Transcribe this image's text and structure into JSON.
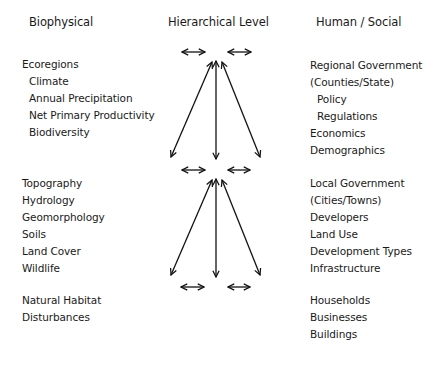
{
  "headers": {
    "biophysical": "Biophysical",
    "hierarchical": "Hierarchical Level",
    "human": "Human / Social"
  },
  "biophysical": {
    "level1": [
      "Ecoregions",
      "Climate",
      "Annual Precipitation",
      "Net Primary Productivity",
      "Biodiversity"
    ],
    "level2": [
      "Topography",
      "Hydrology",
      "Geomorphology",
      "Soils",
      "Land Cover",
      "Wildlife"
    ],
    "level3": [
      "Natural Habitat",
      "Disturbances"
    ]
  },
  "human": {
    "level1": [
      "Regional Government",
      "(Counties/State)",
      "Policy",
      "Regulations",
      "Economics",
      "Demographics"
    ],
    "level2": [
      "Local Government",
      "(Cities/Towns)",
      "Developers",
      "Land Use",
      "Development Types",
      "Infrastructure"
    ],
    "level3": [
      "Households",
      "Businesses",
      "Buildings"
    ]
  },
  "arrows": {
    "horizontal_rows_y": [
      52,
      170,
      287
    ],
    "fans": [
      {
        "top_y": 62,
        "bottom_y": 158
      },
      {
        "top_y": 180,
        "bottom_y": 276
      }
    ],
    "color": "#111111"
  }
}
